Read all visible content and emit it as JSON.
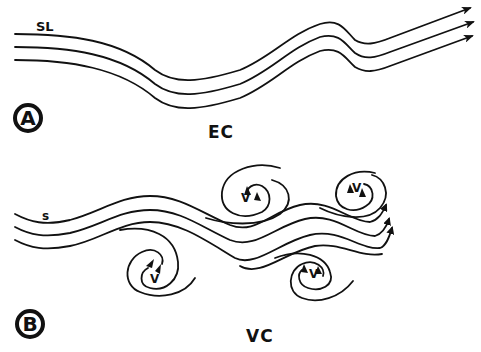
{
  "panels": [
    {
      "badge": "A",
      "caption": "EC",
      "streamline_label": "SL",
      "streamline_count": 3,
      "vortex_count": 0
    },
    {
      "badge": "B",
      "caption": "VC",
      "streamline_label": "s",
      "streamline_count": 4,
      "vortex_count": 4,
      "vortices": [
        {
          "label": "V"
        },
        {
          "label": "V"
        },
        {
          "label": "V"
        },
        {
          "label": "V"
        }
      ]
    }
  ],
  "colors": {
    "ink": "#111111",
    "background": "#ffffff"
  }
}
